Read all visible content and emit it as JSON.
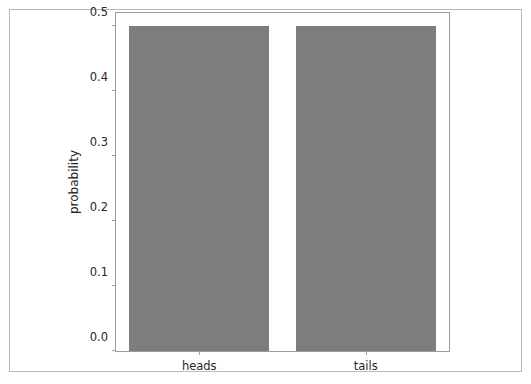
{
  "chart_data": {
    "type": "bar",
    "title": "",
    "xlabel": "",
    "ylabel": "probability",
    "categories": [
      "heads",
      "tails"
    ],
    "values": [
      0.5,
      0.5
    ],
    "ylim": [
      0.0,
      0.52
    ],
    "yticks": [
      "0.0",
      "0.1",
      "0.2",
      "0.3",
      "0.4",
      "0.5"
    ],
    "ytick_values": [
      0.0,
      0.1,
      0.2,
      0.3,
      0.4,
      0.5
    ],
    "xticks": [
      "heads",
      "tails"
    ],
    "grid": false,
    "legend": null,
    "bar_color": "#7d7d7d",
    "axes_color": "#9c9c9c",
    "figure_border_color": "#b9b9b9",
    "text_color": "#262626",
    "background": "#ffffff"
  }
}
